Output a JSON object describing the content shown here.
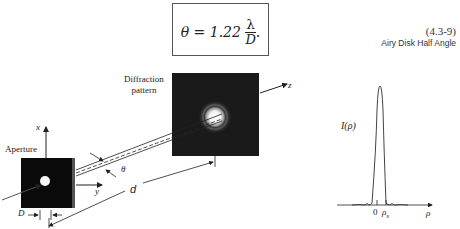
{
  "equation": {
    "lhs": "θ = 1.22",
    "numerator": "λ",
    "denominator": "D",
    "trailing": ".",
    "number": "(4.3-9)",
    "caption": "Airy Disk Half Angle"
  },
  "diagram": {
    "labels": {
      "diffraction_pattern_line1": "Diffraction",
      "diffraction_pattern_line2": "pattern",
      "aperture": "Aperture",
      "x_axis": "x",
      "y_axis": "y",
      "z_axis": "z",
      "theta": "θ",
      "distance": "d",
      "diameter": "D"
    },
    "colors": {
      "screen": "#1a1a1a",
      "aperture": "#0a0a0a",
      "spot": "#ffffff",
      "line": "#222222"
    }
  },
  "plot": {
    "ylabel": "I(ρ)",
    "xlabel": "ρ",
    "ticks": [
      "0",
      "ρs"
    ],
    "tick_origin": "0",
    "tick_rho_s_main": "ρ",
    "tick_rho_s_sub": "s"
  }
}
